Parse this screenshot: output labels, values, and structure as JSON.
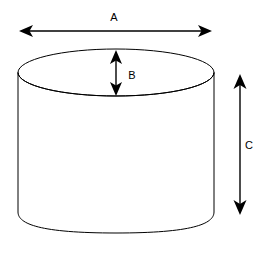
{
  "diagram": {
    "background_color": "#ffffff",
    "line_color": "#000000",
    "shape": "cylinder",
    "canvas": {
      "width": 271,
      "height": 255
    },
    "labels": {
      "a": "A",
      "b": "B",
      "c": "C"
    },
    "dimensions": [
      {
        "id": "a",
        "label": "A",
        "meaning": "overall width / diameter of cylinder top",
        "orientation": "horizontal",
        "label_x": 114,
        "label_y": 18,
        "start_x": 19,
        "end_x": 212,
        "axis_y": 31
      },
      {
        "id": "b",
        "label": "B",
        "meaning": "minor axis / vertical depth of top ellipse",
        "orientation": "vertical",
        "label_x": 132,
        "label_y": 76,
        "start_y": 50,
        "end_y": 96,
        "axis_x": 116
      },
      {
        "id": "c",
        "label": "C",
        "meaning": "height of cylinder body",
        "orientation": "vertical",
        "label_x": 248,
        "label_y": 146,
        "start_y": 74,
        "end_y": 215,
        "axis_x": 240
      }
    ],
    "cylinder_geometry": {
      "ellipse_center_x": 116,
      "ellipse_center_y": 72.5,
      "ellipse_rx": 98,
      "ellipse_ry": 23.5,
      "side_left_x": 18,
      "side_right_x": 214,
      "side_bottom_y": 221,
      "bottom_curve_depth_y": 233
    }
  }
}
